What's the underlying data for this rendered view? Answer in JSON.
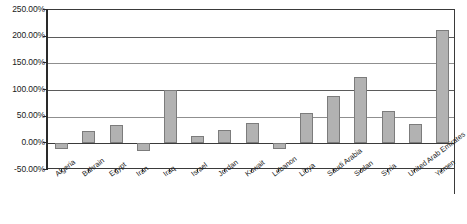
{
  "chart_data": {
    "type": "bar",
    "title": "",
    "subtitle": "",
    "xlabel": "",
    "ylabel": "",
    "categories": [
      "Algeria",
      "Bahrain",
      "Egypt",
      "Iran",
      "Iraq",
      "Israel",
      "Jordan",
      "Kuwait",
      "Lebanon",
      "Libya",
      "Saudi Arabia",
      "Sudan",
      "Syria",
      "United Arab Emirates",
      "Yemen"
    ],
    "values": [
      -10,
      23,
      34,
      -14,
      100,
      14,
      25,
      38,
      -11,
      56,
      88,
      124,
      61,
      36,
      212
    ],
    "value_unit": "%",
    "ylim": [
      -50,
      250
    ],
    "ytick_values": [
      250,
      200,
      150,
      100,
      50,
      0,
      -50
    ],
    "ytick_labels": [
      "250.00%",
      "200.00%",
      "150.00%",
      "100.00%",
      "50.00%",
      "0.00%",
      "-50.00%"
    ],
    "grid": true,
    "legend": false,
    "legend_position": "none",
    "series": [
      {
        "name": "",
        "values": [
          -10,
          23,
          34,
          -14,
          100,
          14,
          25,
          38,
          -11,
          56,
          88,
          124,
          61,
          36,
          212
        ]
      }
    ],
    "colors": {
      "bar_fill": "#b2b2b2",
      "bar_border": "#7c7c7c",
      "gridline": "#5b5b5b",
      "axis": "#2a2a2a",
      "background": "#ffffff",
      "text": "#1a1a1a"
    }
  }
}
